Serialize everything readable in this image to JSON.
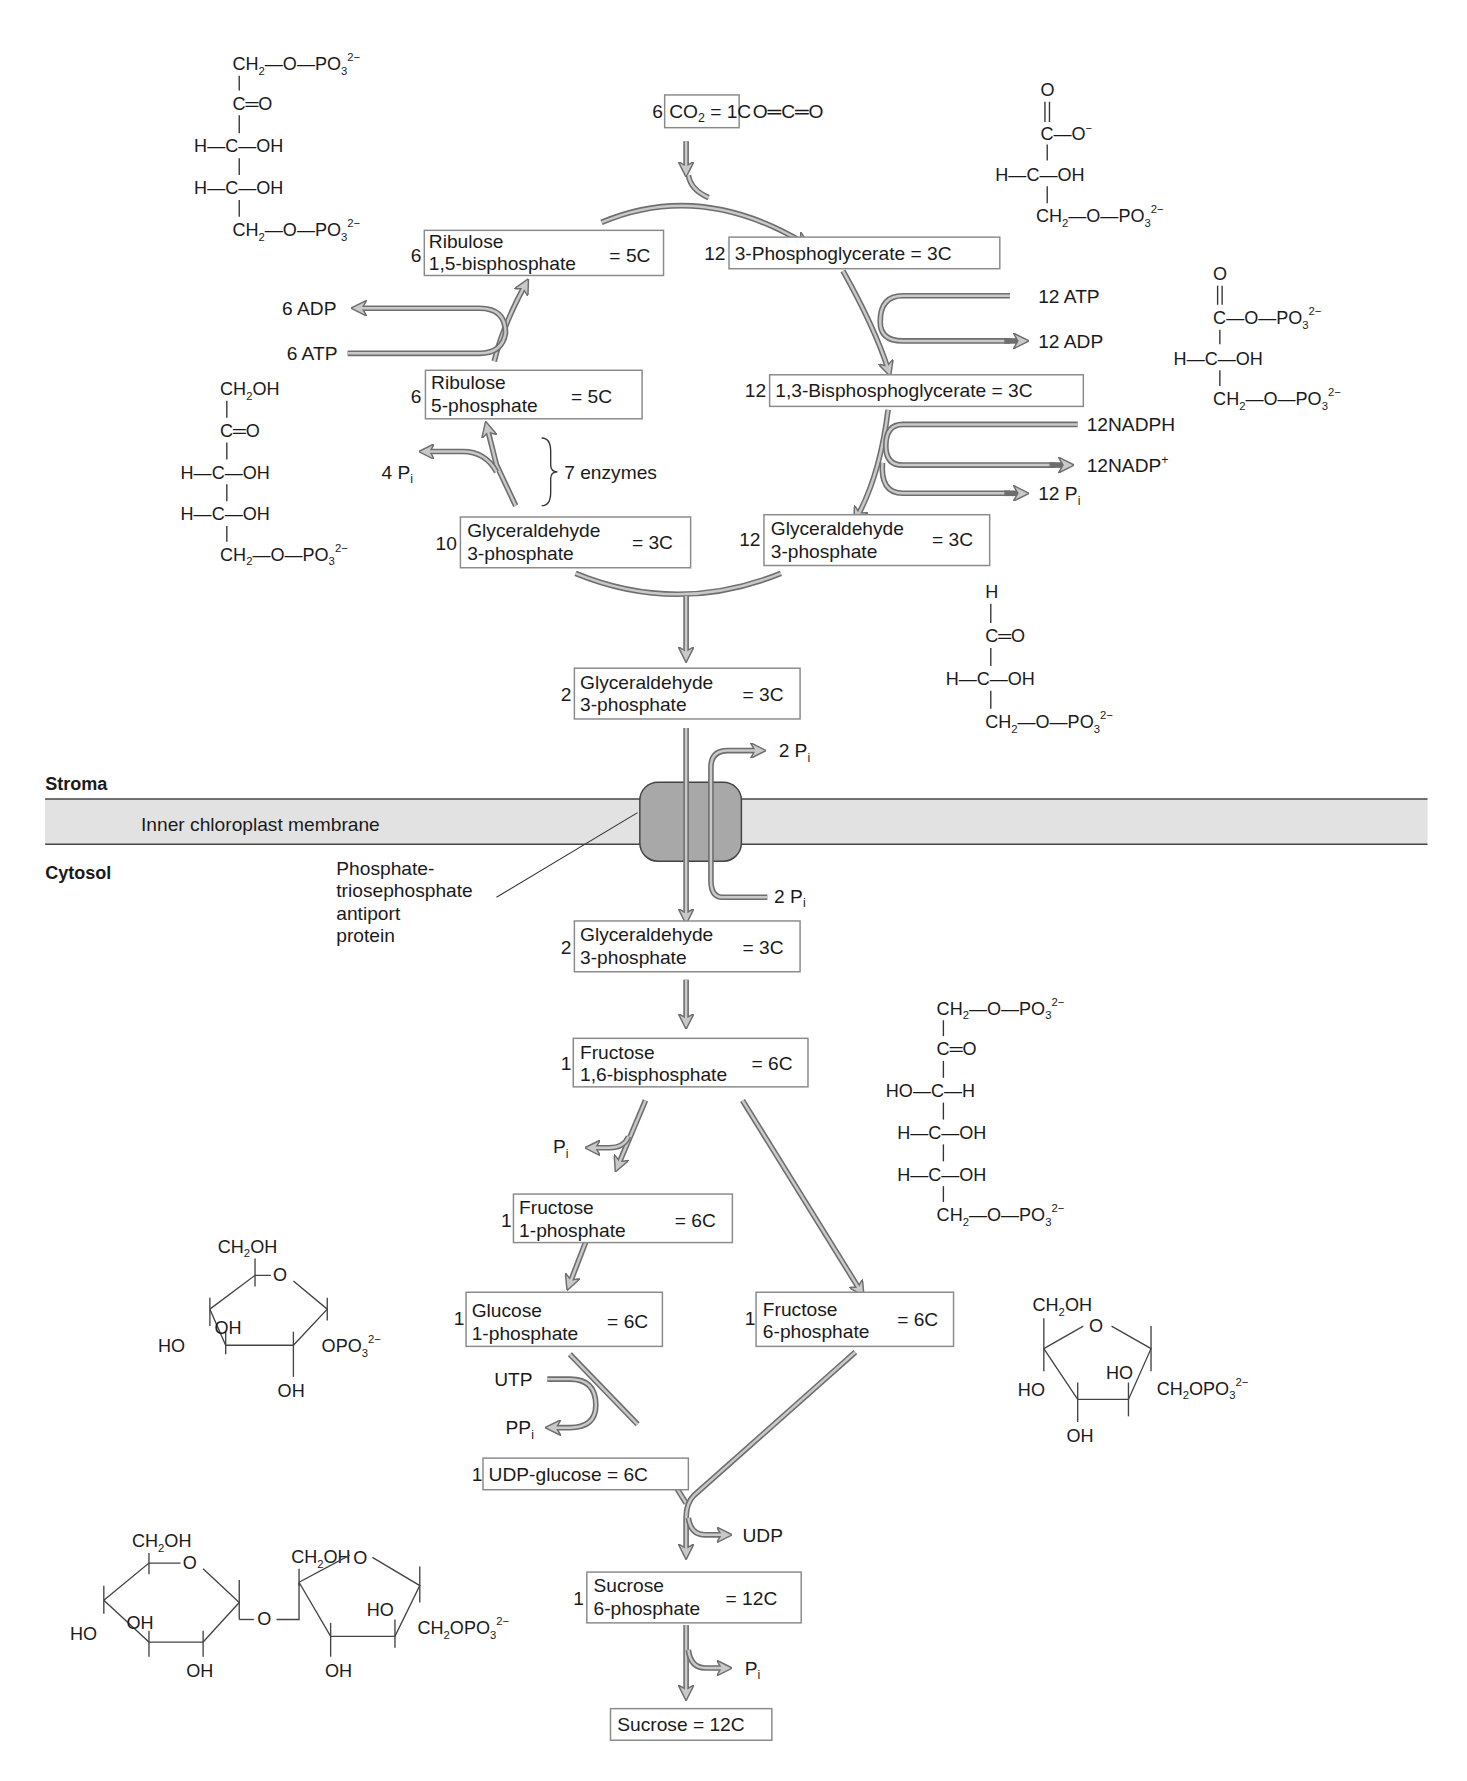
{
  "diagram": {
    "regions": {
      "stroma": "Stroma",
      "cytosol": "Cytosol",
      "membrane": "Inner chloroplast membrane",
      "transporter": [
        "Phosphate-",
        "triosephosphate",
        "antiport",
        "protein"
      ]
    },
    "calvin_cycle": {
      "co2": {
        "count": "6",
        "name": "CO",
        "sub": "2",
        "eq": " = 1C",
        "structure": "O═C═O"
      },
      "rubp": {
        "count": "6",
        "line1": "Ribulose",
        "line2": "1,5-bisphosphate",
        "eq": "= 5C"
      },
      "pga": {
        "count": "12",
        "name": "3-Phosphoglycerate = 3C"
      },
      "bpg": {
        "count": "12",
        "name": "1,3-Bisphosphoglycerate = 3C"
      },
      "g3p12": {
        "count": "12",
        "line1": "Glyceraldehyde",
        "line2": "3-phosphate",
        "eq": "= 3C"
      },
      "g3p10": {
        "count": "10",
        "line1": "Glyceraldehyde",
        "line2": "3-phosphate",
        "eq": "= 3C"
      },
      "ru5p": {
        "count": "6",
        "line1": "Ribulose",
        "line2": "5-phosphate",
        "eq": "= 5C"
      },
      "g3p2_stroma": {
        "count": "2",
        "line1": "Glyceraldehyde",
        "line2": "3-phosphate",
        "eq": "= 3C"
      },
      "side": {
        "atp12": "12 ATP",
        "adp12": "12 ADP",
        "nadph": "12NADPH",
        "nadp": "12NADP",
        "nadp_sup": "+",
        "pi12": "12 P",
        "pi_sub": "i",
        "adp6": "6 ADP",
        "atp6": "6 ATP",
        "pi4": "4 P",
        "enzymes": "7 enzymes",
        "pi2_out": "2 P",
        "pi2_in": "2 P"
      }
    },
    "sucrose_synthesis": {
      "g3p2_cytosol": {
        "count": "2",
        "line1": "Glyceraldehyde",
        "line2": "3-phosphate",
        "eq": "= 3C"
      },
      "fbp": {
        "count": "1",
        "line1": "Fructose",
        "line2": "1,6-bisphosphate",
        "eq": "= 6C"
      },
      "f1p": {
        "count": "1",
        "line1": "Fructose",
        "line2": "1-phosphate",
        "eq": "= 6C"
      },
      "g1p": {
        "count": "1",
        "line1": "Glucose",
        "line2": "1-phosphate",
        "eq": "= 6C"
      },
      "f6p": {
        "count": "1",
        "line1": "Fructose",
        "line2": "6-phosphate",
        "eq": "= 6C"
      },
      "udpg": {
        "count": "1",
        "name": "UDP-glucose = 6C"
      },
      "s6p": {
        "count": "1",
        "line1": "Sucrose",
        "line2": "6-phosphate",
        "eq": "= 12C"
      },
      "sucrose": {
        "name": "Sucrose = 12C"
      },
      "side": {
        "pi": "P",
        "utp": "UTP",
        "ppi": "PP",
        "udp": "UDP",
        "pi_final": "P"
      }
    },
    "structures": {
      "ch2": "CH",
      "two": "2",
      "o_po3": "—O—PO",
      "three": "3",
      "charge2": "2−",
      "c_eq_o": "C═O",
      "h_c_oh": "H—C—OH",
      "ho_c_h": "HO—C—H",
      "c": "C",
      "o": "O",
      "o_minus": "O",
      "minus": "−",
      "h": "H",
      "oh": "OH",
      "ho": "HO",
      "ch2oh": "CH",
      "opo3": "OPO",
      "ch2opo3": "CH"
    }
  }
}
